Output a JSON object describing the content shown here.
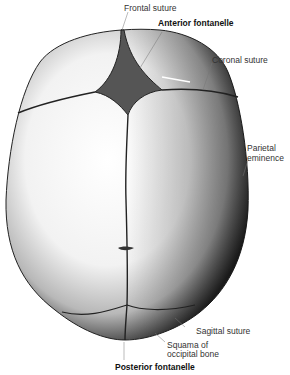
{
  "figure": {
    "labels": [
      {
        "id": "frontal-suture",
        "text": "Frontal suture",
        "bold": false
      },
      {
        "id": "anterior-fontanelle",
        "text": "Anterior fontanelle",
        "bold": true
      },
      {
        "id": "coronal-suture",
        "text": "Coronal suture",
        "bold": false
      },
      {
        "id": "parietal-eminence",
        "line1": "Parietal",
        "line2": "eminence",
        "bold": false
      },
      {
        "id": "sagittal-suture",
        "text": "Sagittal suture",
        "bold": false
      },
      {
        "id": "squama-occipital",
        "line1": "Squama of",
        "line2": "occipital bone",
        "bold": false
      },
      {
        "id": "posterior-fontanelle",
        "text": "Posterior fontanelle",
        "bold": true
      }
    ]
  }
}
